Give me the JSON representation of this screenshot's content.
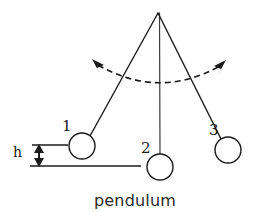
{
  "figure": {
    "caption": "pendulum",
    "stroke_color": "#1a1a1a",
    "background_color": "#ffffff"
  },
  "labels": {
    "position_1": "1",
    "position_2": "2",
    "position_3": "3",
    "height": "h"
  },
  "diagram_data": {
    "type": "physics-schematic",
    "subject": "pendulum",
    "pivot": {
      "x": 158,
      "y": 13
    },
    "bob_radius": 13,
    "bobs": [
      {
        "id": "1",
        "cx": 82,
        "cy": 146,
        "label": "1",
        "label_x": 63,
        "label_y": 130
      },
      {
        "id": "2",
        "cx": 160,
        "cy": 167,
        "label": "2",
        "label_x": 142,
        "label_y": 152
      },
      {
        "id": "3",
        "cx": 228,
        "cy": 150,
        "label": "3",
        "label_x": 210,
        "label_y": 134
      }
    ],
    "rods": [
      {
        "from": "pivot",
        "to": "bob-1"
      },
      {
        "from": "pivot",
        "to": "bob-2"
      },
      {
        "from": "pivot",
        "to": "bob-3"
      }
    ],
    "swing_arc": {
      "style": "dashed",
      "left_arrow_tip": {
        "x": 92,
        "y": 60
      },
      "right_arrow_tip": {
        "x": 226,
        "y": 61
      },
      "lowest_point": {
        "x": 159,
        "y": 88
      },
      "double_headed": true
    },
    "height_marker": {
      "label": "h",
      "upper_line_y": 145,
      "lower_line_y": 166,
      "arrow_x": 39,
      "upper_line_x1": 32,
      "upper_line_x2": 68,
      "baseline_x1": 30,
      "baseline_x2": 141
    },
    "baseline": {
      "y": 166,
      "x1": 30,
      "x2": 141
    }
  }
}
